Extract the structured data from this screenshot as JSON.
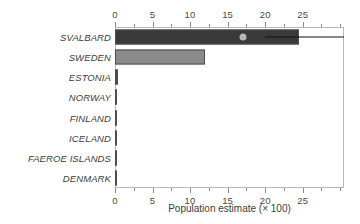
{
  "chart_data": {
    "type": "bar",
    "orientation": "horizontal",
    "title": "",
    "xlabel": "Population estimate (× 100)",
    "ylabel": "",
    "xlim": [
      0,
      30.5
    ],
    "grid": false,
    "legend": "none",
    "axes": {
      "top_axis": true,
      "bottom_axis": true,
      "major_ticks": [
        0,
        5,
        10,
        15,
        20,
        25
      ],
      "major_tick_labels": [
        "0",
        "5",
        "10",
        "15",
        "20",
        "25"
      ],
      "minor_ticks": [
        2.5,
        7.5,
        12.5,
        17.5,
        22.5,
        27.5,
        30
      ]
    },
    "categories": [
      "SVALBARD",
      "SWEDEN",
      "ESTONIA",
      "NORWAY",
      "FINLAND",
      "ICELAND",
      "FAEROE ISLANDS",
      "DENMARK"
    ],
    "values": [
      24.5,
      12.0,
      0.35,
      0.2,
      0.15,
      0.12,
      0.1,
      0.08
    ],
    "bar_colors": [
      "#3a3a3a",
      "#8a8a8a",
      "#4a4a4a",
      "#3a3a3a",
      "#3a3a3a",
      "#8a8a8a",
      "#3a3a3a",
      "#8a8a8a"
    ],
    "annotations": {
      "marker": {
        "category": "SVALBARD",
        "value": 17.0,
        "shape": "circle",
        "color": "#b8b8b8"
      },
      "whisker": {
        "category": "SVALBARD",
        "from": 20.0,
        "to": 30.5,
        "color": "#111111"
      }
    }
  },
  "colors": {
    "frame": "#b9b9b9",
    "tick": "#8c8c8c",
    "text": "#3c3c3c",
    "bar_dark": "#3a3a3a",
    "bar_light": "#8a8a8a",
    "marker": "#b8b8b8",
    "whisker": "#111111",
    "background": "#ffffff"
  }
}
